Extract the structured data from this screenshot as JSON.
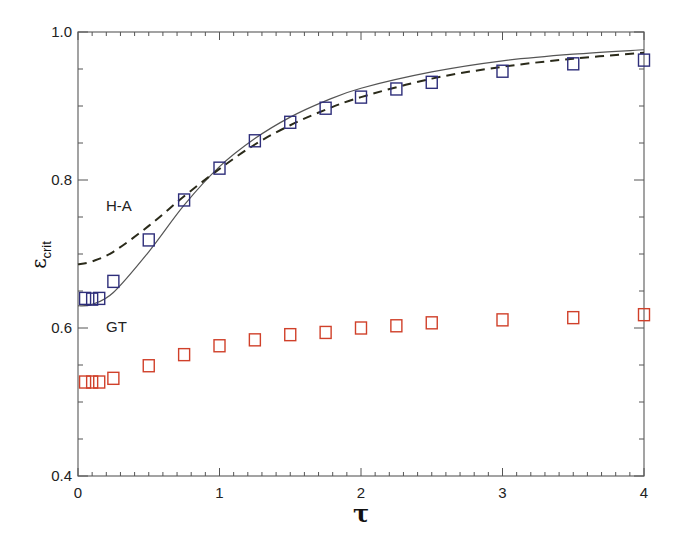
{
  "chart_data": {
    "type": "scatter",
    "title": "",
    "xlabel": "τ",
    "ylabel": "ε",
    "ylabel_subscript": "crit",
    "xlim": [
      0,
      4
    ],
    "ylim": [
      0.4,
      1.0
    ],
    "x_ticks": [
      "0",
      "1",
      "2",
      "3",
      "4"
    ],
    "y_ticks": [
      "0.4",
      "0.6",
      "0.8",
      "1.0"
    ],
    "grid": false,
    "annotations": [
      {
        "text": "H-A",
        "x": 0.25,
        "y": 0.77
      },
      {
        "text": "GT",
        "x": 0.25,
        "y": 0.598
      }
    ],
    "series": [
      {
        "name": "H-A data",
        "kind": "markers",
        "marker": "open-square",
        "color": "#2e2e7a",
        "x": [
          0.05,
          0.1,
          0.15,
          0.25,
          0.5,
          0.75,
          1.0,
          1.25,
          1.5,
          1.75,
          2.0,
          2.25,
          2.5,
          3.0,
          3.5,
          4.0
        ],
        "y": [
          0.64,
          0.639,
          0.64,
          0.663,
          0.719,
          0.773,
          0.816,
          0.853,
          0.878,
          0.897,
          0.912,
          0.923,
          0.932,
          0.947,
          0.957,
          0.962
        ]
      },
      {
        "name": "GT data",
        "kind": "markers",
        "marker": "open-square",
        "color": "#d0402a",
        "x": [
          0.05,
          0.1,
          0.15,
          0.25,
          0.5,
          0.75,
          1.0,
          1.25,
          1.5,
          1.75,
          2.0,
          2.25,
          2.5,
          3.0,
          3.5,
          4.0
        ],
        "y": [
          0.527,
          0.527,
          0.527,
          0.532,
          0.549,
          0.564,
          0.576,
          0.584,
          0.591,
          0.594,
          0.6,
          0.603,
          0.607,
          0.611,
          0.614,
          0.618
        ]
      },
      {
        "name": "solid curve",
        "kind": "line",
        "style": "solid",
        "color": "#555555",
        "x": [
          0,
          0.1,
          0.25,
          0.5,
          0.75,
          1.0,
          1.25,
          1.5,
          1.75,
          2.0,
          2.5,
          3.0,
          3.5,
          4.0
        ],
        "y": [
          0.63,
          0.632,
          0.648,
          0.703,
          0.766,
          0.818,
          0.856,
          0.885,
          0.907,
          0.924,
          0.946,
          0.961,
          0.97,
          0.976
        ]
      },
      {
        "name": "dashed curve",
        "kind": "line",
        "style": "dashed",
        "color": "#2a2a1a",
        "x": [
          0,
          0.1,
          0.25,
          0.5,
          0.75,
          1.0,
          1.25,
          1.5,
          1.75,
          2.0,
          2.5,
          3.0,
          3.5,
          4.0
        ],
        "y": [
          0.686,
          0.69,
          0.703,
          0.738,
          0.778,
          0.815,
          0.848,
          0.874,
          0.895,
          0.912,
          0.937,
          0.953,
          0.964,
          0.972
        ]
      }
    ]
  }
}
